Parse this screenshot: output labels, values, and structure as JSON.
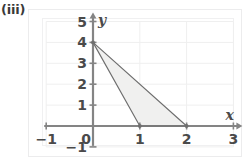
{
  "figure": {
    "label": "(iii)"
  },
  "chart_data": {
    "type": "line",
    "title": "",
    "subtitle": "",
    "xlabel": "x",
    "ylabel": "y",
    "xlim": [
      -1,
      3
    ],
    "ylim": [
      -1,
      5
    ],
    "grid": true,
    "legend": "none",
    "x_ticks": [
      {
        "value": -1,
        "label": "−1"
      },
      {
        "value": 0,
        "label": "0"
      },
      {
        "value": 1,
        "label": "1"
      },
      {
        "value": 2,
        "label": "2"
      },
      {
        "value": 3,
        "label": "3"
      }
    ],
    "y_ticks": [
      {
        "value": 5,
        "label": "5"
      },
      {
        "value": 4,
        "label": "4"
      },
      {
        "value": 3,
        "label": "3"
      },
      {
        "value": 2,
        "label": "2"
      },
      {
        "value": 1,
        "label": "1"
      },
      {
        "value": 0,
        "label": "0"
      },
      {
        "value": -1,
        "label": "−1"
      }
    ],
    "shaded_region": {
      "name": "feasible-region-triangle",
      "vertices": [
        [
          0,
          4
        ],
        [
          1,
          0
        ],
        [
          2,
          0
        ]
      ],
      "fill_color": "#f0f0ef",
      "edge_color": "#6e6e6e"
    },
    "series": [
      {
        "name": "line-through-(0,4)-and-(1,0)",
        "points": [
          [
            0,
            4
          ],
          [
            1,
            0
          ]
        ],
        "color": "#6e6e6e"
      },
      {
        "name": "line-through-(0,4)-and-(2,0)",
        "points": [
          [
            0,
            4
          ],
          [
            2,
            0
          ]
        ],
        "color": "#6e6e6e"
      },
      {
        "name": "segment-on-x-axis-(1,0)-to-(2,0)",
        "points": [
          [
            1,
            0
          ],
          [
            2,
            0
          ]
        ],
        "color": "#6e6e6e"
      }
    ],
    "vertex_markers": [
      {
        "name": "vertex-0-4",
        "x": 0,
        "y": 4
      },
      {
        "name": "vertex-1-0",
        "x": 1,
        "y": 0
      },
      {
        "name": "vertex-2-0",
        "x": 2,
        "y": 0
      }
    ],
    "colors": {
      "axis": "#848484",
      "grid": "#efefef",
      "outline": "#6e6e6e",
      "fill": "#f0f0ef",
      "text": "#4a4a4a"
    }
  }
}
